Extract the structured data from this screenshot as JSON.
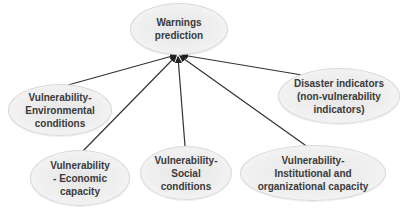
{
  "diagram": {
    "type": "hub-diagram",
    "root": {
      "id": "warnings",
      "label": "Warnings\nprediction"
    },
    "nodes": [
      {
        "id": "environmental",
        "label": "Vulnerability-\nEnvironmental\nconditions"
      },
      {
        "id": "disaster",
        "label": "Disaster indicators\n(non-vulnerability\nindicators)"
      },
      {
        "id": "economic",
        "label": "Vulnerability\n- Economic\ncapacity"
      },
      {
        "id": "social",
        "label": "Vulnerability-\nSocial\nconditions"
      },
      {
        "id": "institutional",
        "label": "Vulnerability-\nInstitutional and\norganizational capacity"
      }
    ],
    "edges": [
      {
        "from": "environmental",
        "to": "warnings",
        "arrow": true
      },
      {
        "from": "disaster",
        "to": "warnings",
        "arrow": true
      },
      {
        "from": "economic",
        "to": "warnings",
        "arrow": true
      },
      {
        "from": "social",
        "to": "warnings",
        "arrow": true
      },
      {
        "from": "institutional",
        "to": "warnings",
        "arrow": true
      }
    ],
    "colors": {
      "node_fill": "#ececec",
      "node_border": "#d9d9d9",
      "text": "#3a3a3a",
      "edge": "#333333"
    }
  }
}
